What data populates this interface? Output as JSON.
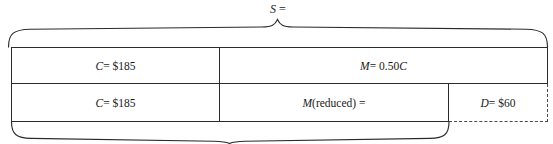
{
  "diagram": {
    "kind": "bar-model-diagram",
    "top_brace": {
      "label_italic": "S",
      "label_rest": " =",
      "label_full": "S =",
      "span_label": "selling-price"
    },
    "bottom_brace": {
      "label": "",
      "span_label": "reduced-selling-price"
    },
    "rows": [
      {
        "name": "original-price-row",
        "cells": [
          {
            "name": "cost-cell",
            "italic": "C",
            "rest": " = $185",
            "text": "C = $185"
          },
          {
            "name": "markup-cell",
            "italic": "M",
            "rest": " = 0.50",
            "italic2": "C",
            "text": "M = 0.50C"
          }
        ]
      },
      {
        "name": "reduced-price-row",
        "cells": [
          {
            "name": "cost-cell",
            "italic": "C",
            "rest": " = $185",
            "text": "C = $185"
          },
          {
            "name": "reduced-markup-cell",
            "italic": "M",
            "rest": "(reduced) =",
            "text": "M(reduced) ="
          },
          {
            "name": "discount-cell",
            "italic": "D",
            "rest": " = $60",
            "text": "D = $60"
          }
        ]
      }
    ],
    "colors": {
      "line": "#2b2b2b",
      "dashed_line": "#4a4a4a",
      "text": "#1a1a1a",
      "background": "#ffffff"
    }
  }
}
